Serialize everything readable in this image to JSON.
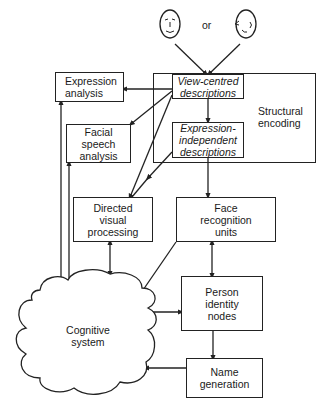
{
  "diagram": {
    "type": "flow",
    "title_hint": "Functional model of face recognition",
    "input": {
      "face_front_icon": "frontal-face",
      "connector": "or",
      "face_profile_icon": "profile-face"
    },
    "nodes": {
      "structural_encoding": {
        "label": "Structural\nencoding"
      },
      "view_centred": {
        "label": "View-centred\ndescriptions"
      },
      "expression_independent": {
        "label": "Expression-\nindependent\ndescriptions"
      },
      "expression_analysis": {
        "label": "Expression\nanalysis"
      },
      "facial_speech": {
        "label": "Facial\nspeech\nanalysis"
      },
      "directed_visual": {
        "label": "Directed\nvisual\nprocessing"
      },
      "face_recognition_units": {
        "label": "Face\nrecognition\nunits"
      },
      "person_identity_nodes": {
        "label": "Person\nidentity\nnodes"
      },
      "name_generation": {
        "label": "Name\ngeneration"
      },
      "cognitive_system": {
        "label": "Cognitive\nsystem"
      }
    },
    "edges": [
      {
        "from": "face_inputs",
        "to": "view_centred",
        "dir": "forward"
      },
      {
        "from": "view_centred",
        "to": "expression_independent",
        "dir": "forward"
      },
      {
        "from": "view_centred",
        "to": "expression_analysis",
        "dir": "forward"
      },
      {
        "from": "view_centred",
        "to": "facial_speech",
        "dir": "forward"
      },
      {
        "from": "view_centred",
        "to": "directed_visual",
        "dir": "forward"
      },
      {
        "from": "expression_independent",
        "to": "directed_visual",
        "dir": "forward"
      },
      {
        "from": "expression_independent",
        "to": "face_recognition_units",
        "dir": "forward"
      },
      {
        "from": "expression_analysis",
        "to": "cognitive_system",
        "dir": "bidirectional"
      },
      {
        "from": "facial_speech",
        "to": "cognitive_system",
        "dir": "bidirectional"
      },
      {
        "from": "directed_visual",
        "to": "cognitive_system",
        "dir": "bidirectional"
      },
      {
        "from": "face_recognition_units",
        "to": "person_identity_nodes",
        "dir": "bidirectional"
      },
      {
        "from": "face_recognition_units",
        "to": "cognitive_system",
        "dir": "forward"
      },
      {
        "from": "person_identity_nodes",
        "to": "cognitive_system",
        "dir": "bidirectional"
      },
      {
        "from": "person_identity_nodes",
        "to": "name_generation",
        "dir": "forward"
      },
      {
        "from": "name_generation",
        "to": "cognitive_system",
        "dir": "forward"
      }
    ]
  }
}
